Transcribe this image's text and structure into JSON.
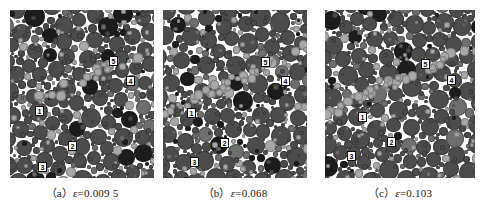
{
  "figure": {
    "type": "granular-packing-simulation-figure",
    "background_color": "#ffffff",
    "panel_count": 3
  },
  "panels": [
    {
      "id": "a",
      "caption_index": "（a）",
      "caption_symbol": "ε",
      "caption_relation": "=",
      "caption_value": "0.009 5",
      "caption_full": "（a）ε=0.009 5",
      "strain": 0.0095,
      "region_labels": [
        "1",
        "2",
        "3",
        "4",
        "5"
      ]
    },
    {
      "id": "b",
      "caption_index": "（b）",
      "caption_symbol": "ε",
      "caption_relation": "=",
      "caption_value": "0.068",
      "caption_full": "（b）ε=0.068",
      "strain": 0.068,
      "region_labels": [
        "1",
        "2",
        "3",
        "4",
        "5"
      ]
    },
    {
      "id": "c",
      "caption_index": "（c）",
      "caption_symbol": "ε",
      "caption_relation": "=",
      "caption_value": "0.103",
      "caption_full": "（c）ε=0.103",
      "strain": 0.103,
      "region_labels": [
        "1",
        "2",
        "3",
        "4",
        "5"
      ]
    }
  ],
  "colors": {
    "grain_dark": "#4c4c4c",
    "grain_mid": "#6e6e6e",
    "grain_light": "#a8a8a8",
    "grain_black": "#1c1c1c",
    "void": "#fbfbfa",
    "label_bg": "#ffffff",
    "label_border": "#121212",
    "label_text": "#0a0a0a",
    "caption_text": "#1a1a1a"
  },
  "label_positions": {
    "a": [
      {
        "text": "1",
        "x": 25,
        "y": 96
      },
      {
        "text": "2",
        "x": 58,
        "y": 131
      },
      {
        "text": "3",
        "x": 28,
        "y": 152
      },
      {
        "text": "4",
        "x": 116,
        "y": 66
      },
      {
        "text": "5",
        "x": 99,
        "y": 46
      }
    ],
    "b": [
      {
        "text": "1",
        "x": 24,
        "y": 98
      },
      {
        "text": "2",
        "x": 57,
        "y": 128
      },
      {
        "text": "3",
        "x": 27,
        "y": 147
      },
      {
        "text": "4",
        "x": 118,
        "y": 66
      },
      {
        "text": "5",
        "x": 98,
        "y": 47
      }
    ],
    "c": [
      {
        "text": "1",
        "x": 33,
        "y": 102
      },
      {
        "text": "2",
        "x": 62,
        "y": 127
      },
      {
        "text": "3",
        "x": 22,
        "y": 141
      },
      {
        "text": "4",
        "x": 122,
        "y": 65
      },
      {
        "text": "5",
        "x": 96,
        "y": 49
      }
    ]
  }
}
